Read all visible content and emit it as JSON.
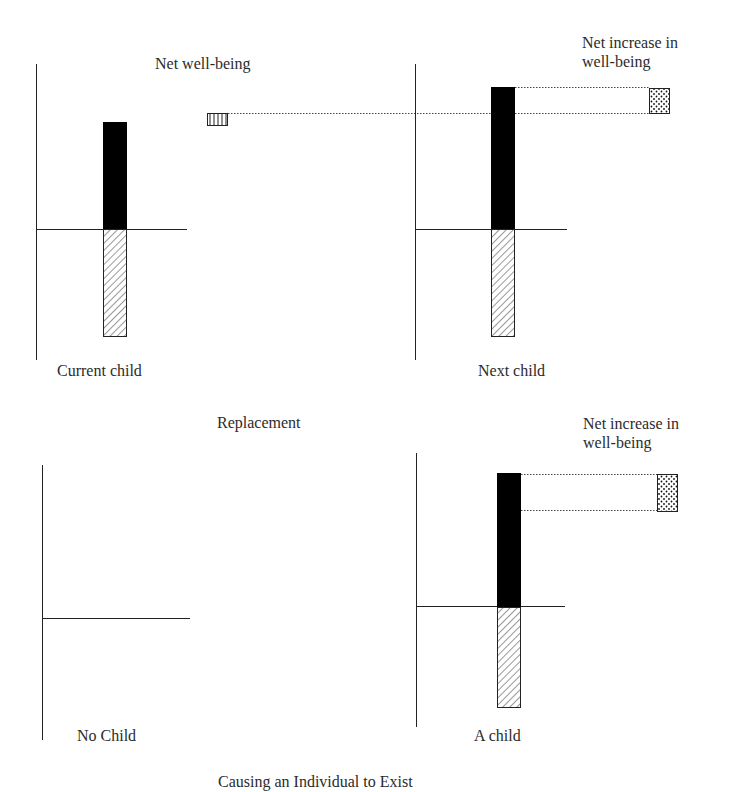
{
  "figure": {
    "top_section": {
      "caption": "Replacement",
      "header_label": "Net well-being",
      "panels": [
        {
          "id": "current-child",
          "label": "Current child",
          "bars": {
            "positive": "black",
            "negative": "hatched"
          },
          "marker": {
            "pattern": "vertical-stripes",
            "meaning": "Net well-being"
          }
        },
        {
          "id": "next-child",
          "label": "Next child",
          "bars": {
            "positive": "black",
            "negative": "hatched"
          },
          "annotation": "Net increase in\nwell-being",
          "marker": {
            "pattern": "dotted",
            "meaning": "Net increase in well-being"
          }
        }
      ]
    },
    "bottom_section": {
      "caption": "Causing an Individual to Exist",
      "panels": [
        {
          "id": "no-child",
          "label": "No Child",
          "bars": null
        },
        {
          "id": "a-child",
          "label": "A child",
          "bars": {
            "positive": "black",
            "negative": "hatched"
          },
          "annotation": "Net increase in\nwell-being",
          "marker": {
            "pattern": "dotted",
            "meaning": "Net increase in well-being"
          }
        }
      ]
    }
  },
  "colors": {
    "ink": "#1a1a1a",
    "bar_fill": "#000000",
    "text": "#2b2b2b",
    "background": "#ffffff"
  }
}
